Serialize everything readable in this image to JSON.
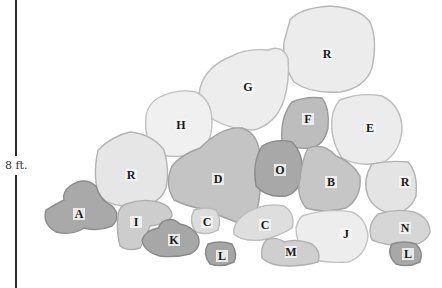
{
  "scale": {
    "label": "8 ft."
  },
  "stones": [
    {
      "label": "R",
      "x": 327,
      "y": 56,
      "fill": "#ececec",
      "stroke": "#b8b8b8",
      "path": "M290,20 Q300,8 330,6 Q360,8 370,22 Q378,40 372,68 Q365,88 340,92 Q310,94 294,82 Q282,64 284,42 Z"
    },
    {
      "label": "G",
      "x": 248,
      "y": 89,
      "fill": "#ededed",
      "stroke": "#bcbcbc",
      "path": "M232,56 Q246,48 268,50 Q282,44 288,58 Q290,80 284,100 Q276,124 254,130 Q232,130 214,120 Q196,108 200,88 Q206,66 232,56 Z"
    },
    {
      "label": "H",
      "x": 181,
      "y": 127,
      "fill": "#f0f0f0",
      "stroke": "#c0c0c0",
      "path": "M158,98 Q176,88 196,92 Q212,100 212,122 Q212,146 196,154 Q172,160 154,152 Q144,138 146,116 Q148,104 158,98 Z"
    },
    {
      "label": "F",
      "x": 308,
      "y": 121,
      "fill": "#bdbdbd",
      "stroke": "#9a9a9a",
      "path": "M292,102 Q306,96 322,98 Q330,108 328,128 Q324,146 310,148 Q292,150 282,140 Q280,118 292,102 Z"
    },
    {
      "label": "E",
      "x": 370,
      "y": 130,
      "fill": "#ececec",
      "stroke": "#bdbdbd",
      "path": "M340,100 Q360,92 382,96 Q402,106 402,130 Q400,152 384,162 Q360,168 342,158 Q330,140 332,118 Q334,106 340,100 Z"
    },
    {
      "label": "R",
      "x": 131,
      "y": 177,
      "fill": "#e6e6e6",
      "stroke": "#b4b4b4",
      "path": "M98,150 Q112,136 130,132 Q152,134 164,150 Q170,170 166,188 Q160,204 140,206 Q114,208 100,198 Q92,178 98,150 Z"
    },
    {
      "label": "D",
      "x": 218,
      "y": 181,
      "fill": "#c4c4c4",
      "stroke": "#a2a2a2",
      "path": "M200,148 Q222,126 242,128 Q260,134 260,160 Q262,186 258,206 Q252,222 236,222 Q220,216 206,210 Q186,206 174,200 Q164,184 172,166 Q182,154 200,148 Z"
    },
    {
      "label": "O",
      "x": 280,
      "y": 172,
      "fill": "#a8a8a8",
      "stroke": "#8a8a8a",
      "path": "M262,146 Q276,138 292,142 Q304,154 302,174 Q300,192 286,196 Q266,198 256,186 Q252,162 262,146 Z"
    },
    {
      "label": "B",
      "x": 331,
      "y": 184,
      "fill": "#c6c6c6",
      "stroke": "#a4a4a4",
      "path": "M308,148 Q324,142 336,156 Q352,162 360,176 Q362,198 346,208 Q324,214 306,208 Q296,196 300,178 Q302,160 308,148 Z"
    },
    {
      "label": "R",
      "x": 405,
      "y": 184,
      "fill": "#e4e4e4",
      "stroke": "#b2b2b2",
      "path": "M372,164 Q388,160 408,162 Q418,172 416,196 Q410,212 392,214 Q374,210 368,196 Q362,180 372,164 Z"
    },
    {
      "label": "A",
      "x": 79,
      "y": 216,
      "fill": "#a9a9a9",
      "stroke": "#8c8c8c",
      "path": "M70,186 Q84,176 96,186 Q100,200 112,206 Q122,216 112,226 Q98,232 84,228 Q72,236 56,232 Q42,224 46,210 Q56,204 64,200 Q62,192 70,186 Z"
    },
    {
      "label": "I",
      "x": 136,
      "y": 224,
      "fill": "#cdcdcd",
      "stroke": "#adadad",
      "path": "M126,204 Q142,198 158,202 Q172,206 172,216 Q168,224 150,226 Q146,238 140,248 Q128,252 120,246 Q116,230 118,214 Q120,206 126,204 Z"
    },
    {
      "label": "C",
      "x": 207,
      "y": 224,
      "fill": "#dcdcdc",
      "stroke": "#bababa",
      "path": "M194,210 Q206,206 216,210 Q222,220 218,230 Q208,236 196,232 Q188,222 194,210 Z"
    },
    {
      "label": "K",
      "x": 174,
      "y": 242,
      "fill": "#a7a7a7",
      "stroke": "#898989",
      "path": "M162,222 Q172,216 180,224 Q192,226 198,236 Q202,248 190,254 Q174,258 160,256 Q144,252 142,240 Q146,230 158,228 Z"
    },
    {
      "label": "C",
      "x": 265,
      "y": 227,
      "fill": "#dedede",
      "stroke": "#bcbcbc",
      "path": "M248,212 Q266,202 284,206 Q296,214 292,228 Q280,236 262,240 Q242,242 234,234 Q232,222 248,212 Z"
    },
    {
      "label": "J",
      "x": 346,
      "y": 236,
      "fill": "#ededed",
      "stroke": "#c2c2c2",
      "path": "M302,216 Q326,208 352,212 Q366,218 368,236 Q366,256 348,262 Q322,264 304,256 Q296,240 296,228 Q298,220 302,216 Z"
    },
    {
      "label": "N",
      "x": 405,
      "y": 230,
      "fill": "#d6d6d6",
      "stroke": "#b4b4b4",
      "path": "M378,214 Q396,208 414,212 Q430,218 430,232 Q426,244 408,246 Q386,246 372,240 Q366,226 378,214 Z"
    },
    {
      "label": "L",
      "x": 222,
      "y": 258,
      "fill": "#a6a6a6",
      "stroke": "#888888",
      "path": "M208,244 Q220,240 232,244 Q238,254 234,262 Q222,268 210,264 Q202,254 208,244 Z"
    },
    {
      "label": "M",
      "x": 291,
      "y": 254,
      "fill": "#cfcfcf",
      "stroke": "#b0b0b0",
      "path": "M266,240 Q276,236 284,242 Q296,238 312,244 Q322,252 318,262 Q304,266 288,266 Q270,266 262,258 Q260,248 266,240 Z"
    },
    {
      "label": "L",
      "x": 408,
      "y": 256,
      "fill": "#a8a8a8",
      "stroke": "#8a8a8a",
      "path": "M392,244 Q404,240 416,244 Q424,252 420,262 Q408,268 396,264 Q386,254 392,244 Z"
    }
  ]
}
